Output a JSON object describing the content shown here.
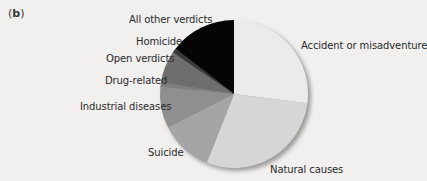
{
  "panel": {
    "open": "(",
    "letter": "b",
    "close": ")"
  },
  "chart_data": {
    "type": "pie",
    "title": "",
    "start_angle_deg": 0,
    "direction": "clockwise",
    "unit": "percent (estimated from slice angles)",
    "categories": [
      "Accident or misadventure",
      "Natural causes",
      "Suicide",
      "Industrial diseases",
      "Drug-related",
      "Open verdicts",
      "Homicide",
      "All other verdicts"
    ],
    "values": [
      27,
      29,
      11.5,
      9,
      1,
      7,
      1,
      14.5
    ],
    "colors": [
      "#ebebeb",
      "#d6d6d6",
      "#a5a5a5",
      "#8f8f8f",
      "#7f7f7f",
      "#6e6e6e",
      "#3a3a3a",
      "#050505"
    ],
    "legend": "none (direct slice labels)"
  },
  "labels": {
    "accident": "Accident or misadventure",
    "natural": "Natural causes",
    "suicide": "Suicide",
    "industrial": "Industrial diseases",
    "drug": "Drug-related",
    "open": "Open verdicts",
    "homicide": "Homicide",
    "other": "All other verdicts"
  }
}
